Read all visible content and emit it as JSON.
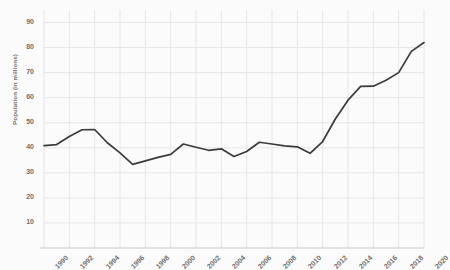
{
  "chart_data": {
    "type": "line",
    "title": "",
    "subtitle": "",
    "xlabel": "",
    "ylabel": "Population (in millions)",
    "grid": true,
    "legend": false,
    "legend_position": "none",
    "line_color": "#3b3b3b",
    "grid_color": "#e6e6e6",
    "background_color": "#fbfbfb",
    "text_color": "#6f6f6f",
    "xlim": [
      1990,
      2020
    ],
    "ylim": [
      0,
      95
    ],
    "y_ticks": [
      10,
      20,
      30,
      40,
      50,
      60,
      70,
      80,
      90
    ],
    "x_ticks": [
      "1990",
      "1992",
      "1994",
      "1996",
      "1998",
      "2000",
      "2002",
      "2004",
      "2006",
      "2008",
      "2010",
      "2012",
      "2014",
      "2016",
      "2018",
      "2020"
    ],
    "x": [
      1990,
      1991,
      1992,
      1993,
      1994,
      1995,
      1996,
      1997,
      1998,
      1999,
      2000,
      2001,
      2002,
      2003,
      2004,
      2005,
      2006,
      2007,
      2008,
      2009,
      2010,
      2011,
      2012,
      2013,
      2014,
      2015,
      2016,
      2017,
      2018,
      2019,
      2020
    ],
    "values": [
      40.9,
      41.3,
      44.5,
      47.2,
      47.3,
      42.0,
      38.0,
      33.4,
      34.8,
      36.2,
      37.4,
      41.5,
      40.2,
      39.0,
      39.6,
      36.5,
      38.5,
      42.2,
      41.5,
      40.8,
      40.4,
      37.8,
      42.5,
      51.5,
      59.0,
      64.5,
      64.6,
      67.0,
      70.0,
      78.5,
      82.0
    ],
    "series": [
      {
        "name": "Population",
        "values": [
          40.9,
          41.3,
          44.5,
          47.2,
          47.3,
          42.0,
          38.0,
          33.4,
          34.8,
          36.2,
          37.4,
          41.5,
          40.2,
          39.0,
          39.6,
          36.5,
          38.5,
          42.2,
          41.5,
          40.8,
          40.4,
          37.8,
          42.5,
          51.5,
          59.0,
          64.5,
          64.6,
          67.0,
          70.0,
          78.5,
          82.0
        ]
      }
    ]
  }
}
